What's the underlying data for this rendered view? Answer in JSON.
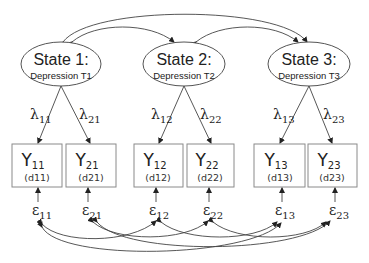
{
  "diagram": {
    "type": "structural-equation-path-diagram",
    "latent_states": [
      {
        "id": "state1",
        "title": "State 1:",
        "subtitle": "Depression T1",
        "cx": 61,
        "cy": 64
      },
      {
        "id": "state2",
        "title": "State 2:",
        "subtitle": "Depression T2",
        "cx": 184,
        "cy": 64
      },
      {
        "id": "state3",
        "title": "State 3:",
        "subtitle": "Depression T3",
        "cx": 309,
        "cy": 64
      }
    ],
    "loadings": [
      {
        "symbol": "λ",
        "sub": "11",
        "from": "state1",
        "to": "Y11"
      },
      {
        "symbol": "λ",
        "sub": "21",
        "from": "state1",
        "to": "Y21"
      },
      {
        "symbol": "λ",
        "sub": "12",
        "from": "state2",
        "to": "Y12"
      },
      {
        "symbol": "λ",
        "sub": "22",
        "from": "state2",
        "to": "Y22"
      },
      {
        "symbol": "λ",
        "sub": "13",
        "from": "state3",
        "to": "Y13"
      },
      {
        "symbol": "λ",
        "sub": "23",
        "from": "state3",
        "to": "Y23"
      }
    ],
    "indicators": [
      {
        "symbol": "Y",
        "sub": "11",
        "code": "(d11)"
      },
      {
        "symbol": "Y",
        "sub": "21",
        "code": "(d21)"
      },
      {
        "symbol": "Y",
        "sub": "12",
        "code": "(d12)"
      },
      {
        "symbol": "Y",
        "sub": "22",
        "code": "(d22)"
      },
      {
        "symbol": "Y",
        "sub": "13",
        "code": "(d13)"
      },
      {
        "symbol": "Y",
        "sub": "23",
        "code": "(d23)"
      }
    ],
    "residuals": [
      {
        "symbol": "ε",
        "sub": "11"
      },
      {
        "symbol": "ε",
        "sub": "21"
      },
      {
        "symbol": "ε",
        "sub": "12"
      },
      {
        "symbol": "ε",
        "sub": "22"
      },
      {
        "symbol": "ε",
        "sub": "13"
      },
      {
        "symbol": "ε",
        "sub": "23"
      }
    ],
    "state_covariances": [
      {
        "from": "state1",
        "to": "state2"
      },
      {
        "from": "state2",
        "to": "state3"
      },
      {
        "from": "state1",
        "to": "state3"
      }
    ],
    "residual_covariances": [
      {
        "from": "ε11",
        "to": "ε12"
      },
      {
        "from": "ε11",
        "to": "ε13"
      },
      {
        "from": "ε21",
        "to": "ε22"
      },
      {
        "from": "ε21",
        "to": "ε23"
      },
      {
        "from": "ε12",
        "to": "ε13"
      },
      {
        "from": "ε22",
        "to": "ε23"
      }
    ],
    "colors": {
      "line": "#444444",
      "box_border": "#8a8a8a",
      "text": "#222222"
    }
  }
}
